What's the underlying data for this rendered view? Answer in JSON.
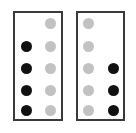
{
  "figure": {
    "background_color": "#ffffff",
    "width": 136,
    "height": 133
  },
  "style": {
    "panel_border_color": "#3a3a3a",
    "panel_border_width": 2,
    "panel_fill_color": "#ffffff",
    "filled_dot_color": "#111111",
    "empty_dot_color": "#c2c2c2",
    "dot_diameter": 11
  },
  "layout": {
    "rows": 5,
    "columns": 2,
    "row_y": [
      23,
      46,
      68,
      90,
      110
    ],
    "panel_column_x": {
      "left_panel": [
        26,
        50
      ],
      "right_panel": [
        88,
        113
      ]
    }
  },
  "panels": [
    {
      "id": "panel-left",
      "label": "left-panel",
      "x": 13,
      "y": 11,
      "width": 50,
      "height": 110,
      "columns": [
        {
          "id": "left-panel-column-1",
          "label": "column-1",
          "cells": [
            "blank",
            "filled",
            "filled",
            "filled",
            "filled"
          ]
        },
        {
          "id": "left-panel-column-2",
          "label": "column-2",
          "cells": [
            "empty",
            "empty",
            "empty",
            "empty",
            "empty"
          ]
        }
      ],
      "filled_count": 4,
      "empty_count": 5
    },
    {
      "id": "panel-right",
      "label": "right-panel",
      "x": 76,
      "y": 11,
      "width": 49,
      "height": 110,
      "columns": [
        {
          "id": "right-panel-column-1",
          "label": "column-1",
          "cells": [
            "empty",
            "empty",
            "empty",
            "empty",
            "empty"
          ]
        },
        {
          "id": "right-panel-column-2",
          "label": "column-2",
          "cells": [
            "blank",
            "blank",
            "filled",
            "filled",
            "filled"
          ]
        }
      ],
      "filled_count": 3,
      "empty_count": 5
    }
  ]
}
